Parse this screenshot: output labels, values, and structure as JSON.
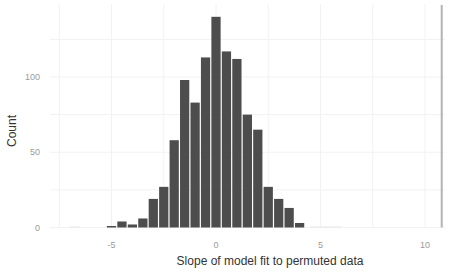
{
  "chart_data": {
    "type": "bar",
    "subtype": "histogram",
    "title": "",
    "xlabel": "Slope of model fit to permuted data",
    "ylabel": "Count",
    "xlim": [
      -7.5,
      11
    ],
    "ylim": [
      0,
      145
    ],
    "x_ticks": [
      -5,
      0,
      5,
      10
    ],
    "y_ticks": [
      0,
      50,
      100
    ],
    "grid": true,
    "bin_width": 0.5,
    "bar_color": "#4d4d4d",
    "reference_line": {
      "x": 10.8,
      "color": "#b3b3b3",
      "orientation": "vertical"
    },
    "bins": [
      {
        "x": -5.0,
        "count": 1
      },
      {
        "x": -4.5,
        "count": 4
      },
      {
        "x": -4.0,
        "count": 2
      },
      {
        "x": -3.5,
        "count": 6
      },
      {
        "x": -3.0,
        "count": 19
      },
      {
        "x": -2.5,
        "count": 27
      },
      {
        "x": -2.0,
        "count": 58
      },
      {
        "x": -1.5,
        "count": 98
      },
      {
        "x": -1.0,
        "count": 83
      },
      {
        "x": -0.5,
        "count": 113
      },
      {
        "x": 0.0,
        "count": 140
      },
      {
        "x": 0.5,
        "count": 117
      },
      {
        "x": 1.0,
        "count": 112
      },
      {
        "x": 1.5,
        "count": 75
      },
      {
        "x": 2.0,
        "count": 65
      },
      {
        "x": 2.5,
        "count": 27
      },
      {
        "x": 3.0,
        "count": 19
      },
      {
        "x": 3.5,
        "count": 13
      },
      {
        "x": 4.0,
        "count": 3
      }
    ],
    "categories": [
      -5.0,
      -4.5,
      -4.0,
      -3.5,
      -3.0,
      -2.5,
      -2.0,
      -1.5,
      -1.0,
      -0.5,
      0.0,
      0.5,
      1.0,
      1.5,
      2.0,
      2.5,
      3.0,
      3.5,
      4.0
    ],
    "values": [
      1,
      4,
      2,
      6,
      19,
      27,
      58,
      98,
      83,
      113,
      140,
      117,
      112,
      75,
      65,
      27,
      19,
      13,
      3
    ]
  },
  "axes": {
    "y_title": "Count",
    "x_title": "Slope of model fit to permuted data",
    "y_tick_labels": [
      "0",
      "50",
      "100"
    ],
    "x_tick_labels": [
      "-5",
      "0",
      "5",
      "10"
    ]
  }
}
